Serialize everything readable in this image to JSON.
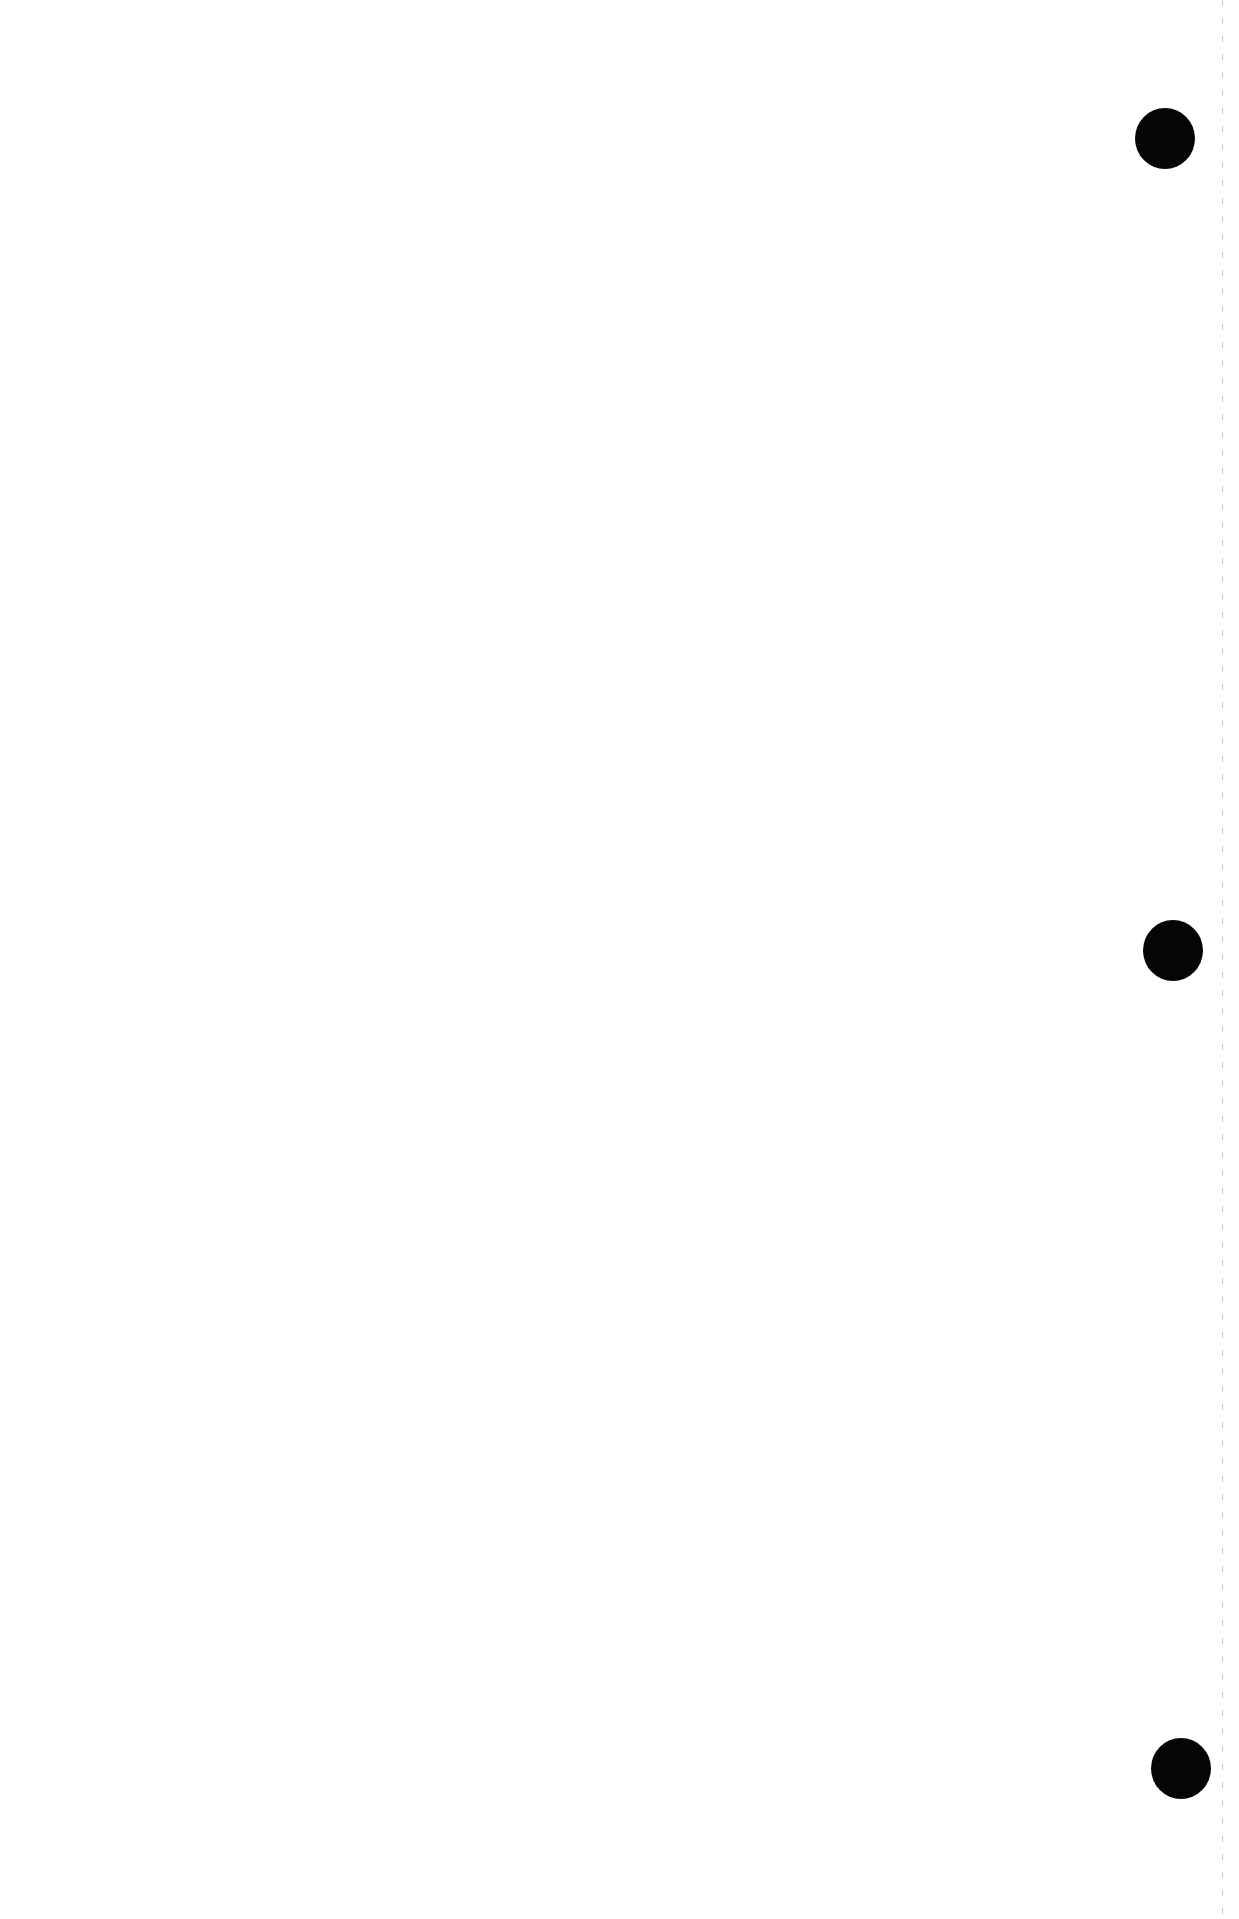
{
  "page": {
    "background": "#ffffff",
    "text_content": ""
  },
  "punch_holes": [
    {
      "label": "top",
      "cx": 1165,
      "cy": 139,
      "color": "#050505"
    },
    {
      "label": "middle",
      "cx": 1173,
      "cy": 950,
      "color": "#050505"
    },
    {
      "label": "bottom",
      "cx": 1181,
      "cy": 1768,
      "color": "#050505"
    }
  ],
  "edge_line": {
    "x": 1222,
    "style": "dashed",
    "color": "#969696"
  }
}
